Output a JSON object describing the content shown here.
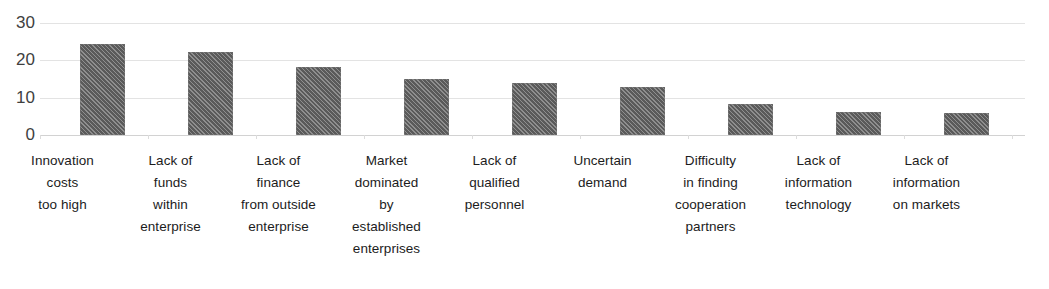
{
  "chart_data": {
    "type": "bar",
    "title": "",
    "subtitle": "",
    "xlabel": "",
    "ylabel": "",
    "ylim": [
      0,
      30
    ],
    "yticks": [
      0,
      10,
      20,
      30
    ],
    "ytick_labels": [
      "0",
      "10",
      "20",
      "30"
    ],
    "grid": true,
    "legend": false,
    "legend_position": "none",
    "orientation": "vertical",
    "bar_color": "#5a5a5a",
    "bar_pattern": "diagonal-hatch",
    "gridline_color": "#e3e3e3",
    "axis_label_color": "#1c1c1c",
    "categories": [
      "Innovation costs too high",
      "Lack of funds within enterprise",
      "Lack of finance from outside enterprise",
      "Market dominated by established enterprises",
      "Lack of qualified personnel",
      "Uncertain demand",
      "Difficulty in finding cooperation partners",
      "Lack of information technology",
      "Lack of information on markets"
    ],
    "category_lines": [
      [
        "Innovation",
        "costs",
        "too high"
      ],
      [
        "Lack of",
        "funds",
        "within",
        "enterprise"
      ],
      [
        "Lack of",
        "finance",
        "from outside",
        "enterprise"
      ],
      [
        "Market",
        "dominated",
        "by",
        "established",
        "enterprises"
      ],
      [
        "Lack of",
        "qualified",
        "personnel"
      ],
      [
        "Uncertain",
        "demand"
      ],
      [
        "Difficulty",
        "in finding",
        "cooperation",
        "partners"
      ],
      [
        "Lack of",
        "information",
        "technology"
      ],
      [
        "Lack of",
        "information",
        "on markets"
      ]
    ],
    "values": [
      24.4,
      22.2,
      18.1,
      15.0,
      14.0,
      12.8,
      8.4,
      6.2,
      5.9
    ]
  }
}
